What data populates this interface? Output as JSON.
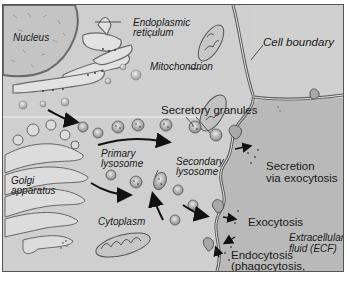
{
  "diagram": {
    "type": "cell-biology-illustration",
    "labels": {
      "nucleus": "Nucleus",
      "er_line1": "Endoplasmic",
      "er_line2": "reticulum",
      "mitochondrion": "Mitochondrion",
      "cell_boundary": "Cell boundary",
      "secretory_granules": "Secretory granules",
      "primary_lysosome_1": "Primary",
      "primary_lysosome_2": "lysosome",
      "secondary_lysosome_1": "Secondary",
      "secondary_lysosome_2": "lysosome",
      "golgi_1": "Golgi",
      "golgi_2": "apparatus",
      "secretion_1": "Secretion",
      "secretion_2": "via exocytosis",
      "cytoplasm": "Cytoplasm",
      "exocytosis": "Exocytosis",
      "ecf_1": "Extracellular",
      "ecf_2": "fluid (ECF)",
      "endocytosis_1": "Endocytosis",
      "endocytosis_2": "(phagocytosis,",
      "endocytosis_3": "pinocytosis)"
    },
    "colors": {
      "cytoplasm": "#d2d2d2",
      "ecf": "#b9b9b9",
      "nucleus": "#c4c4c4",
      "membrane": "#5a5a5a",
      "arrow": "#111111"
    }
  }
}
